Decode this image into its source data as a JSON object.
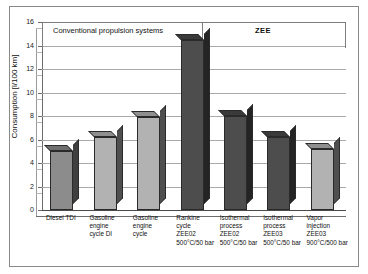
{
  "chart_data": {
    "type": "bar",
    "title": "",
    "xlabel": "",
    "ylabel": "Consumption [l/100 km]",
    "ylim": [
      0,
      16
    ],
    "ytick_step": 2,
    "yticks": [
      "16",
      "14",
      "12",
      "10",
      "8",
      "6",
      "4",
      "2",
      "0"
    ],
    "grid": true,
    "legend": "none",
    "style": "3d-column",
    "categories": [
      "Diesel TDI",
      "Gasoline engine cycle DI",
      "Gasoline engine cycle",
      "Rankine cycle ZEE02 500°C/50 bar",
      "Isothermal process ZEE02 500°C/50 bar",
      "Isothermal process ZEE03 500°C/50 bar",
      "Vapor injection ZEE03 900°C/500 bar"
    ],
    "values": [
      5.0,
      6.2,
      7.9,
      14.5,
      8.0,
      6.2,
      5.2
    ],
    "bar_shades": [
      "mid",
      "light",
      "light",
      "dark",
      "dark",
      "dark",
      "light"
    ],
    "groups": [
      {
        "label": "Conventional propulsion systems",
        "categories": 3
      },
      {
        "label": "ZEE",
        "categories": 4
      }
    ]
  },
  "axis": {
    "y_label": "Consumption [l/100 km]",
    "y_ticks": [
      "16",
      "14",
      "12",
      "10",
      "8",
      "6",
      "4",
      "2",
      "0"
    ]
  },
  "groups": {
    "conventional": "Conventional propulsion systems",
    "zee": "ZEE"
  },
  "xlabels": [
    {
      "lines": [
        "Diesel TDI"
      ]
    },
    {
      "lines": [
        "Gasoline",
        "engine",
        "cycle DI"
      ]
    },
    {
      "lines": [
        "Gasoline",
        "engine",
        "cycle"
      ]
    },
    {
      "lines": [
        "Rankine",
        "cycle",
        "ZEE02",
        "500°C/50 bar"
      ]
    },
    {
      "lines": [
        "Isothermal",
        "process",
        "ZEE02",
        "500°C/50 bar"
      ]
    },
    {
      "lines": [
        "Isothermal",
        "process",
        "ZEE03",
        "500°C/50 bar"
      ]
    },
    {
      "lines": [
        "Vapor",
        "injection",
        "ZEE03",
        "900°C/500 bar"
      ]
    }
  ],
  "colors": {
    "bar_light": "#b2b2b2",
    "bar_mid": "#8c8c8c",
    "bar_dark": "#4d4d4d",
    "grid": "#a9a9a9",
    "frame": "#8a8a8a",
    "text": "#111111"
  }
}
